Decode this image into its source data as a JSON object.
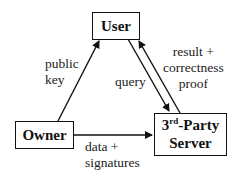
{
  "diagram": {
    "nodes": [
      {
        "id": "user",
        "label": "User"
      },
      {
        "id": "owner",
        "label": "Owner"
      },
      {
        "id": "server",
        "label_prefix": "3",
        "label_sup": "rd",
        "label_suffix": "-Party",
        "label_line2": "Server"
      }
    ],
    "edges": [
      {
        "from": "owner",
        "to": "user",
        "label_line1": "public",
        "label_line2": "key"
      },
      {
        "from": "user",
        "to": "server",
        "label_line1": "query"
      },
      {
        "from": "server",
        "to": "user",
        "label_line1": "result +",
        "label_line2": "correctness",
        "label_line3": "proof"
      },
      {
        "from": "owner",
        "to": "server",
        "label_line1": "data +",
        "label_line2": "signatures"
      }
    ]
  }
}
